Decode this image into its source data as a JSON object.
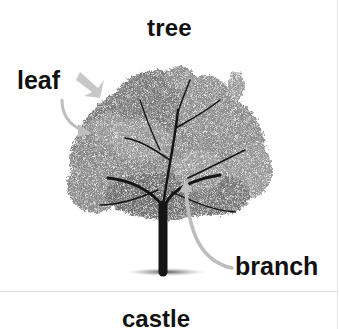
{
  "card": {
    "title": "tree",
    "labels": {
      "leaf": "leaf",
      "branch": "branch"
    },
    "image": {
      "subject": "tree-photo-grayscale",
      "arrows": [
        {
          "name": "leaf-arrow-short",
          "color": "#c8c8c8"
        },
        {
          "name": "leaf-arrow-curved",
          "color": "#bdbdbd"
        },
        {
          "name": "branch-arrow-curved",
          "color": "#bdbdbd"
        }
      ]
    }
  },
  "next_card": {
    "title": "castle"
  },
  "colors": {
    "text": "#111111",
    "arrow": "#bdbdbd",
    "divider": "#dcdcdc",
    "background": "#ffffff"
  }
}
